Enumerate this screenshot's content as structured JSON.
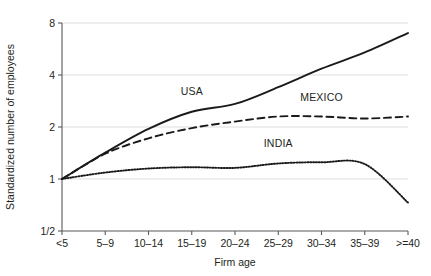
{
  "chart_data": {
    "type": "line",
    "title": "",
    "subtitle": "",
    "xlabel": "Firm age",
    "ylabel": "Standardized number of employees",
    "categories": [
      "<5",
      "5–9",
      "10–14",
      "15–19",
      "20–24",
      "25–29",
      "30–34",
      "35–39",
      ">=40"
    ],
    "yticks": [
      "1/2",
      "1",
      "2",
      "4",
      "8"
    ],
    "ytick_values": [
      0.5,
      1,
      2,
      4,
      8
    ],
    "yscale": "log2",
    "ylim": [
      0.5,
      8
    ],
    "grid": "horizontal",
    "legend_position": "inline-annotations",
    "series": [
      {
        "name": "USA",
        "style": "solid",
        "color": "#1a1a1a",
        "label_x_category": "15–19",
        "values": [
          1.0,
          1.42,
          1.95,
          2.45,
          2.72,
          3.4,
          4.35,
          5.4,
          7.0
        ]
      },
      {
        "name": "MEXICO",
        "style": "dashed",
        "color": "#1a1a1a",
        "label_x_category": "30–34",
        "values": [
          1.0,
          1.4,
          1.72,
          1.97,
          2.15,
          2.3,
          2.3,
          2.24,
          2.3
        ]
      },
      {
        "name": "INDIA",
        "style": "dotted",
        "color": "#1a1a1a",
        "label_x_category": "25–29",
        "values": [
          1.0,
          1.09,
          1.15,
          1.17,
          1.16,
          1.23,
          1.25,
          1.22,
          0.73
        ]
      }
    ],
    "annotations": [
      {
        "text": "USA",
        "series": "USA"
      },
      {
        "text": "MEXICO",
        "series": "MEXICO"
      },
      {
        "text": "INDIA",
        "series": "INDIA"
      }
    ]
  },
  "plot_geometry": {
    "left": 62,
    "right": 408,
    "top": 23,
    "bottom": 231
  }
}
